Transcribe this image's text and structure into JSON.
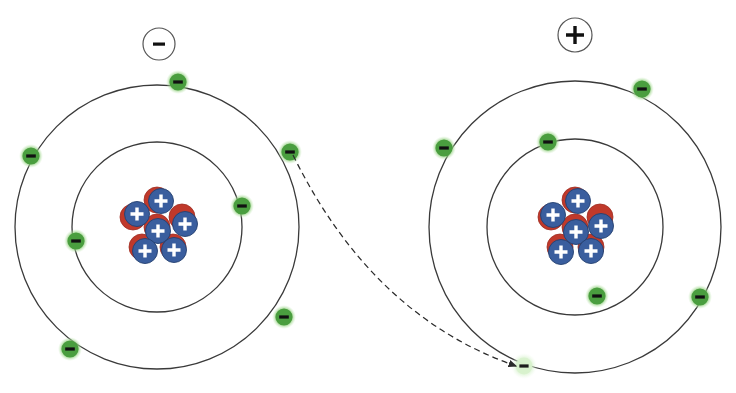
{
  "diagram": {
    "background_color": "#ffffff",
    "width": 736,
    "height": 393
  },
  "palette": {
    "orbit_stroke": "#3a3a3a",
    "electron_fill": "#4a9e3f",
    "electron_glow": "#8ccf7a",
    "electron_sign": "#111111",
    "electron_faded_fill": "#cdeec4",
    "electron_faded_glow": "#e4f6dc",
    "proton_fill": "#3a5e9e",
    "proton_stroke": "#24406f",
    "proton_sign": "#ffffff",
    "neutron_fill": "#c0392b",
    "neutron_stroke": "#9e2d22",
    "arrow_stroke": "#2b2b2b",
    "badge_stroke": "#555555",
    "badge_sign": "#111111"
  },
  "charge_badges": [
    {
      "id": "charge-badge-negative",
      "label": "−",
      "name": "negative",
      "cx": 159,
      "cy": 44,
      "r": 16
    },
    {
      "id": "charge-badge-positive",
      "label": "+",
      "name": "positive",
      "cx": 575,
      "cy": 35,
      "r": 17
    }
  ],
  "atoms": [
    {
      "id": "atom-left",
      "name": "left-atom-anion",
      "charge_label": "−",
      "center": {
        "x": 157,
        "y": 227
      },
      "orbits": [
        {
          "id": "outer",
          "radius": 142,
          "electron_count": 5
        },
        {
          "id": "inner",
          "radius": 85,
          "electron_count": 2
        }
      ],
      "nucleus": {
        "proton_count": 6,
        "neutron_count": 6,
        "proton_label": "+",
        "radius": 30
      },
      "electrons": [
        {
          "name": "electron-outer-top",
          "shell": "outer",
          "x": 178,
          "y": 82,
          "label": "−",
          "state": "normal"
        },
        {
          "name": "electron-outer-left",
          "shell": "outer",
          "x": 31,
          "y": 156,
          "label": "−",
          "state": "normal"
        },
        {
          "name": "electron-outer-right",
          "shell": "outer",
          "x": 290,
          "y": 152,
          "label": "−",
          "state": "normal"
        },
        {
          "name": "electron-outer-lower-right",
          "shell": "outer",
          "x": 284,
          "y": 317,
          "label": "−",
          "state": "normal"
        },
        {
          "name": "electron-outer-lower-left",
          "shell": "outer",
          "x": 70,
          "y": 349,
          "label": "−",
          "state": "normal"
        },
        {
          "name": "electron-inner-right",
          "shell": "inner",
          "x": 242,
          "y": 206,
          "label": "−",
          "state": "normal"
        },
        {
          "name": "electron-inner-left",
          "shell": "inner",
          "x": 76,
          "y": 241,
          "label": "−",
          "state": "normal"
        }
      ]
    },
    {
      "id": "atom-right",
      "name": "right-atom-cation",
      "charge_label": "+",
      "center": {
        "x": 575,
        "y": 227
      },
      "orbits": [
        {
          "id": "outer",
          "radius": 146,
          "electron_count": 4
        },
        {
          "id": "inner",
          "radius": 88,
          "electron_count": 2
        }
      ],
      "nucleus": {
        "proton_count": 6,
        "neutron_count": 6,
        "proton_label": "+",
        "radius": 30
      },
      "electrons": [
        {
          "name": "electron-outer-upper-right",
          "shell": "outer",
          "x": 642,
          "y": 89,
          "label": "−",
          "state": "normal"
        },
        {
          "name": "electron-outer-left",
          "shell": "outer",
          "x": 444,
          "y": 148,
          "label": "−",
          "state": "normal"
        },
        {
          "name": "electron-outer-right",
          "shell": "outer",
          "x": 700,
          "y": 297,
          "label": "−",
          "state": "normal"
        },
        {
          "name": "electron-outer-incoming",
          "shell": "outer",
          "x": 524,
          "y": 366,
          "label": "−",
          "state": "faded"
        },
        {
          "name": "electron-inner-top",
          "shell": "inner",
          "x": 548,
          "y": 142,
          "label": "−",
          "state": "normal"
        },
        {
          "name": "electron-inner-bottom",
          "shell": "inner",
          "x": 597,
          "y": 296,
          "label": "−",
          "state": "normal"
        }
      ]
    }
  ],
  "transfer_arrow": {
    "name": "electron-transfer-arrow",
    "style": "dashed",
    "from": {
      "x": 293,
      "y": 155
    },
    "to": {
      "x": 519,
      "y": 366
    },
    "control": {
      "x": 360,
      "y": 330
    },
    "dash_pattern": "6,4",
    "description": "Dashed curved arrow showing an electron moving from the left atom's outer shell to the right atom's outer shell"
  },
  "accessible_summary": "Two Bohr-model atoms. The left atom is labeled minus and has five electrons in its outer shell; the right atom is labeled plus and has a vacant outer-shell position being filled. A dashed curved arrow traces an electron transferring from the left atom to the right atom."
}
